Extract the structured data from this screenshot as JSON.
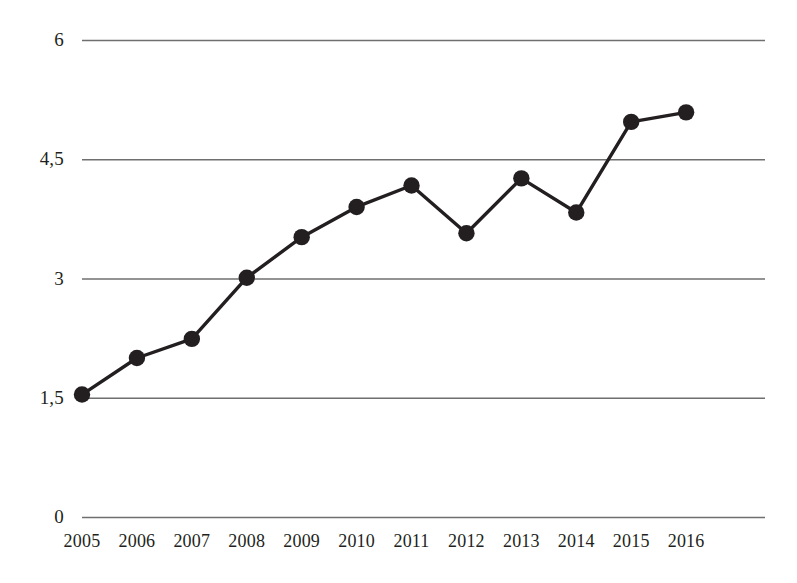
{
  "chart_data": {
    "type": "line",
    "title": "",
    "subtitle": "",
    "xlabel": "",
    "ylabel": "",
    "categories": [
      "2005",
      "2006",
      "2007",
      "2008",
      "2009",
      "2010",
      "2011",
      "2012",
      "2013",
      "2014",
      "2015",
      "2016"
    ],
    "values": [
      1.54,
      2.0,
      2.24,
      3.01,
      3.52,
      3.9,
      4.17,
      3.57,
      4.26,
      3.83,
      4.97,
      5.09
    ],
    "series": [
      {
        "name": "",
        "values": [
          1.54,
          2.0,
          2.24,
          3.01,
          3.52,
          3.9,
          4.17,
          3.57,
          4.26,
          3.83,
          4.97,
          5.09
        ]
      }
    ],
    "ylim": [
      0,
      6
    ],
    "xlim": [
      "2005",
      "2016"
    ],
    "ytick_labels": [
      "6",
      "4,5",
      "3",
      "1,5",
      "0"
    ],
    "ytick_values": [
      6,
      4.5,
      3,
      1.5,
      0
    ],
    "xtick_labels": [
      "2005",
      "2006",
      "2007",
      "2008",
      "2009",
      "2010",
      "2011",
      "2012",
      "2013",
      "2014",
      "2015",
      "2016"
    ],
    "grid": true,
    "grid_axis": "y",
    "legend": false,
    "legend_position": "none",
    "markers": true,
    "marker_shape": "circle",
    "annotations": [],
    "colors": {
      "line": "#231f20",
      "marker": "#231f20",
      "grid": "#6f6f6f",
      "background": "#ffffff",
      "text": "#231f20"
    }
  },
  "axes": {
    "y": {
      "ticks": [
        {
          "label": "6",
          "value": 6
        },
        {
          "label": "4,5",
          "value": 4.5
        },
        {
          "label": "3",
          "value": 3
        },
        {
          "label": "1,5",
          "value": 1.5
        },
        {
          "label": "0",
          "value": 0
        }
      ]
    },
    "x": {
      "ticks": [
        {
          "label": "2005"
        },
        {
          "label": "2006"
        },
        {
          "label": "2007"
        },
        {
          "label": "2008"
        },
        {
          "label": "2009"
        },
        {
          "label": "2010"
        },
        {
          "label": "2011"
        },
        {
          "label": "2012"
        },
        {
          "label": "2013"
        },
        {
          "label": "2014"
        },
        {
          "label": "2015"
        },
        {
          "label": "2016"
        }
      ]
    }
  }
}
